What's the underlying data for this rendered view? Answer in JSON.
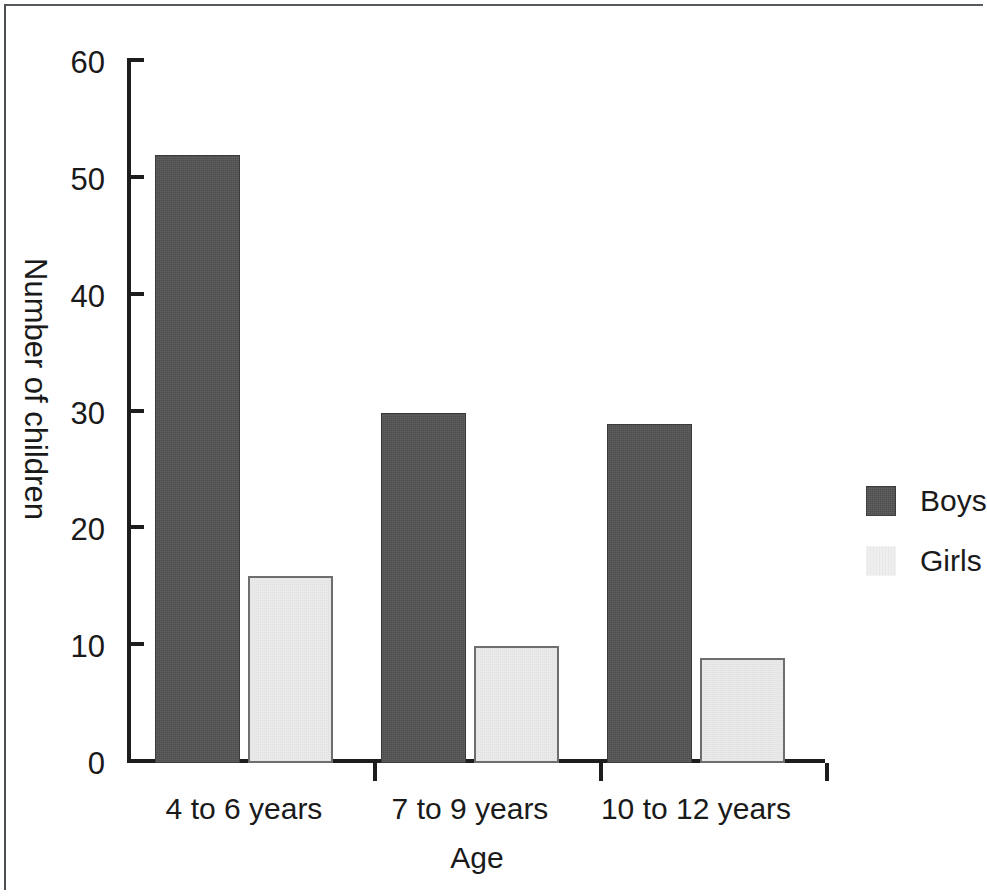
{
  "chart_data": {
    "type": "bar",
    "title": "",
    "subtitle": "",
    "xlabel": "Age",
    "ylabel": "Number of children",
    "categories": [
      "4 to 6 years",
      "7 to 9 years",
      "10 to 12 years"
    ],
    "series": [
      {
        "name": "Boys",
        "values": [
          52,
          30,
          29
        ],
        "color": "#4d4d4d"
      },
      {
        "name": "Girls",
        "values": [
          16,
          10,
          9
        ],
        "color": "#ececec"
      }
    ],
    "ylim": [
      0,
      60
    ],
    "ytick_labels": [
      "0",
      "10",
      "20",
      "30",
      "40",
      "50",
      "60"
    ],
    "ytick_values": [
      0,
      10,
      20,
      30,
      40,
      50,
      60
    ],
    "grid": false,
    "legend_position": "right",
    "legend_entries": [
      "Boys",
      "Girls"
    ]
  },
  "colors": {
    "boys": "#4d4d4d",
    "girls": "#ececec",
    "axis": "#1d1d1d",
    "text": "#1a1a1a",
    "frame": "#555a5e",
    "background": "#ffffff"
  }
}
